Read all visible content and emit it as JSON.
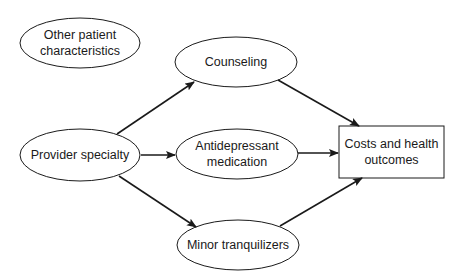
{
  "diagram": {
    "nodes": [
      {
        "id": "other",
        "label_line1": "Other patient",
        "label_line2": "characteristics",
        "shape": "ellipse"
      },
      {
        "id": "provider",
        "label": "Provider specialty",
        "shape": "ellipse"
      },
      {
        "id": "counseling",
        "label": "Counseling",
        "shape": "ellipse"
      },
      {
        "id": "antidepressant",
        "label_line1": "Antidepressant",
        "label_line2": "medication",
        "shape": "ellipse"
      },
      {
        "id": "tranquilizers",
        "label": "Minor tranquilizers",
        "shape": "ellipse"
      },
      {
        "id": "outcomes",
        "label_line1": "Costs and health",
        "label_line2": "outcomes",
        "shape": "rectangle"
      }
    ],
    "edges": [
      {
        "from": "provider",
        "to": "counseling"
      },
      {
        "from": "provider",
        "to": "antidepressant"
      },
      {
        "from": "provider",
        "to": "tranquilizers"
      },
      {
        "from": "counseling",
        "to": "outcomes"
      },
      {
        "from": "antidepressant",
        "to": "outcomes"
      },
      {
        "from": "tranquilizers",
        "to": "outcomes"
      }
    ],
    "colors": {
      "stroke": "#1a1a1a",
      "background": "#ffffff"
    }
  }
}
